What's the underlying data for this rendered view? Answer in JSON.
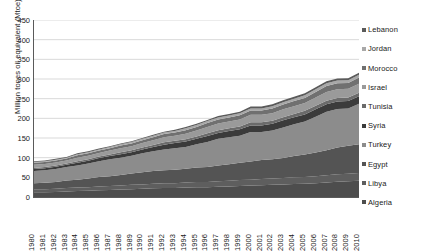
{
  "chart_data": {
    "type": "area",
    "stacked": true,
    "title": "",
    "xlabel": "",
    "ylabel": "Million tones oil equivalent (Mtoe)",
    "ylim": [
      0,
      450
    ],
    "ytick_step": 50,
    "yticks": [
      0,
      50,
      100,
      150,
      200,
      250,
      300,
      350,
      400,
      450
    ],
    "grid": true,
    "grid_axis": "y",
    "legend_position": "right",
    "x": [
      1980,
      1981,
      1982,
      1983,
      1984,
      1985,
      1986,
      1987,
      1988,
      1989,
      1990,
      1991,
      1992,
      1993,
      1994,
      1995,
      1996,
      1997,
      1998,
      1999,
      2000,
      2001,
      2002,
      2003,
      2004,
      2005,
      2006,
      2007,
      2008,
      2009,
      2010
    ],
    "series": [
      {
        "name": "Algeria",
        "color": "#4d4d4d",
        "values": [
          12,
          12,
          13,
          14,
          15,
          16,
          17,
          18,
          19,
          20,
          21,
          22,
          23,
          23,
          24,
          25,
          25,
          26,
          27,
          28,
          29,
          30,
          31,
          32,
          33,
          34,
          35,
          37,
          39,
          40,
          41
        ]
      },
      {
        "name": "Libya",
        "color": "#5e5e5e",
        "values": [
          8,
          8,
          8,
          9,
          9,
          9,
          10,
          10,
          10,
          11,
          11,
          12,
          12,
          12,
          13,
          13,
          13,
          14,
          14,
          15,
          15,
          16,
          16,
          16,
          17,
          17,
          18,
          18,
          19,
          19,
          20
        ]
      },
      {
        "name": "Egypt",
        "color": "#545454",
        "values": [
          15,
          16,
          17,
          19,
          20,
          22,
          24,
          25,
          27,
          29,
          31,
          32,
          33,
          34,
          35,
          37,
          38,
          40,
          42,
          44,
          46,
          48,
          49,
          51,
          54,
          57,
          60,
          64,
          68,
          71,
          73
        ]
      },
      {
        "name": "Turkey",
        "color": "#8c8c8c",
        "values": [
          31,
          32,
          33,
          34,
          36,
          38,
          40,
          43,
          44,
          45,
          48,
          50,
          53,
          55,
          55,
          59,
          64,
          68,
          69,
          69,
          75,
          71,
          73,
          78,
          81,
          84,
          91,
          98,
          98,
          95,
          103
        ]
      },
      {
        "name": "Syria",
        "color": "#3b3b3b",
        "values": [
          5,
          5,
          6,
          6,
          7,
          7,
          8,
          8,
          9,
          9,
          10,
          11,
          12,
          13,
          14,
          14,
          15,
          15,
          16,
          16,
          17,
          17,
          17,
          18,
          18,
          18,
          19,
          19,
          19,
          19,
          19
        ]
      },
      {
        "name": "Tunisia",
        "color": "#6b6b6b",
        "values": [
          3,
          3,
          3,
          3,
          4,
          4,
          4,
          4,
          5,
          5,
          5,
          5,
          6,
          6,
          6,
          6,
          7,
          7,
          7,
          7,
          8,
          8,
          8,
          8,
          8,
          9,
          9,
          9,
          9,
          9,
          9
        ]
      },
      {
        "name": "Israel",
        "color": "#9a9a9a",
        "values": [
          8,
          8,
          8,
          8,
          9,
          9,
          9,
          10,
          10,
          10,
          11,
          12,
          13,
          13,
          14,
          15,
          16,
          17,
          17,
          18,
          19,
          19,
          19,
          20,
          20,
          20,
          21,
          22,
          22,
          22,
          23
        ]
      },
      {
        "name": "Morocco",
        "color": "#707070",
        "values": [
          5,
          5,
          5,
          5,
          6,
          6,
          6,
          6,
          7,
          7,
          7,
          8,
          8,
          8,
          9,
          9,
          10,
          10,
          10,
          11,
          11,
          11,
          12,
          12,
          13,
          13,
          14,
          15,
          15,
          15,
          16
        ]
      },
      {
        "name": "Jordan",
        "color": "#a8a8a8",
        "values": [
          2,
          2,
          2,
          2,
          3,
          3,
          3,
          3,
          3,
          4,
          4,
          4,
          4,
          4,
          5,
          5,
          5,
          5,
          5,
          5,
          5,
          5,
          6,
          6,
          6,
          7,
          7,
          7,
          7,
          7,
          7
        ]
      },
      {
        "name": "Lebanon",
        "color": "#5a5a5a",
        "values": [
          2,
          2,
          2,
          2,
          2,
          2,
          2,
          2,
          2,
          2,
          2,
          2,
          2,
          3,
          3,
          3,
          3,
          4,
          4,
          4,
          5,
          5,
          5,
          5,
          5,
          5,
          5,
          5,
          5,
          5,
          5
        ]
      }
    ]
  },
  "legend": {
    "items": [
      {
        "label": "Lebanon"
      },
      {
        "label": "Jordan"
      },
      {
        "label": "Morocco"
      },
      {
        "label": "Israel"
      },
      {
        "label": "Tunisia"
      },
      {
        "label": "Syria"
      },
      {
        "label": "Turkey"
      },
      {
        "label": "Egypt"
      },
      {
        "label": "Libya"
      },
      {
        "label": "Algeria"
      }
    ]
  },
  "axes": {
    "y_title": "Million tones oil equivalent (Mtoe)"
  }
}
